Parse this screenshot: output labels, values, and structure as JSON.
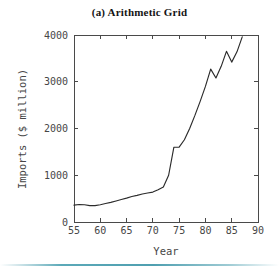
{
  "figure": {
    "title": "(a)  Arithmetic Grid",
    "bottom_rule_color": "#4f9fb0",
    "background_color": "#ffffff",
    "line_color": "#2b2b2b",
    "axis_color": "#4a4a4a"
  },
  "chart_data": {
    "type": "line",
    "title": "(a)  Arithmetic Grid",
    "xlabel": "Year",
    "ylabel": "Imports ($ million)",
    "xlim": [
      55,
      90
    ],
    "ylim": [
      0,
      4000
    ],
    "xticks": [
      55,
      60,
      65,
      70,
      75,
      80,
      85,
      90
    ],
    "xtick_labels": [
      "55",
      "60",
      "65",
      "70",
      "75",
      "80",
      "85",
      "90"
    ],
    "yticks": [
      0,
      1000,
      2000,
      3000,
      4000
    ],
    "ytick_labels": [
      "0",
      "1000",
      "2000",
      "3000",
      "4000"
    ],
    "grid": false,
    "legend": null,
    "series": [
      {
        "name": "Imports",
        "x": [
          55,
          56,
          57,
          58,
          59,
          60,
          61,
          62,
          63,
          64,
          65,
          66,
          67,
          68,
          69,
          70,
          71,
          72,
          73,
          74,
          75,
          76,
          77,
          78,
          79,
          80,
          81,
          82,
          83,
          84,
          85,
          86,
          87
        ],
        "values": [
          360,
          375,
          370,
          350,
          350,
          370,
          395,
          420,
          450,
          480,
          510,
          545,
          570,
          600,
          620,
          640,
          690,
          750,
          1000,
          1600,
          1600,
          1760,
          2000,
          2280,
          2580,
          2900,
          3270,
          3080,
          3330,
          3650,
          3420,
          3640,
          3960
        ]
      }
    ]
  },
  "axes": {
    "x_title": "Year",
    "y_title": "Imports ($ million)"
  }
}
